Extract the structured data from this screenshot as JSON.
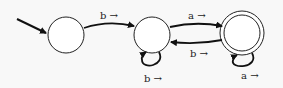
{
  "diagram": {
    "type": "finite-state-automaton",
    "states": [
      {
        "id": "q0",
        "start": true,
        "accepting": false
      },
      {
        "id": "q1",
        "start": false,
        "accepting": false
      },
      {
        "id": "q2",
        "start": false,
        "accepting": true
      }
    ],
    "transitions": [
      {
        "from": "q0",
        "to": "q1",
        "label": "b →"
      },
      {
        "from": "q1",
        "to": "q2",
        "label": "a →"
      },
      {
        "from": "q2",
        "to": "q1",
        "label": "b →"
      },
      {
        "from": "q1",
        "to": "q1",
        "label": "b →"
      },
      {
        "from": "q2",
        "to": "q2",
        "label": "a →"
      }
    ]
  }
}
